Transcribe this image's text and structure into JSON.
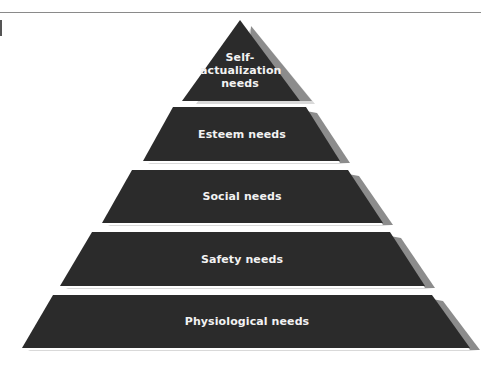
{
  "diagram": {
    "type": "pyramid",
    "colors": {
      "layer_fill": "#2b2b2b",
      "shadow_fill": "#8c8c8c",
      "highlight_fill": "#d9d9d9",
      "label_color": "#f2f2f2",
      "background": "#ffffff"
    },
    "levels": [
      {
        "label_line1": "Self-",
        "label_line2": "actualization",
        "label_line3": "needs"
      },
      {
        "label": "Esteem needs"
      },
      {
        "label": "Social needs"
      },
      {
        "label": "Safety needs"
      },
      {
        "label": "Physiological needs"
      }
    ]
  }
}
